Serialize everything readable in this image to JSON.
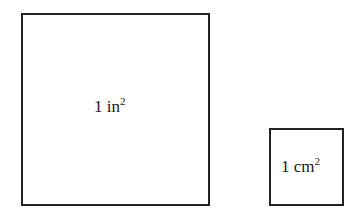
{
  "diagram": {
    "shapes": [
      {
        "id": "square-inch",
        "kind": "square",
        "label_value": "1 in",
        "label_exponent": "2"
      },
      {
        "id": "square-centimeter",
        "kind": "square",
        "label_value": "1 cm",
        "label_exponent": "2"
      }
    ]
  }
}
